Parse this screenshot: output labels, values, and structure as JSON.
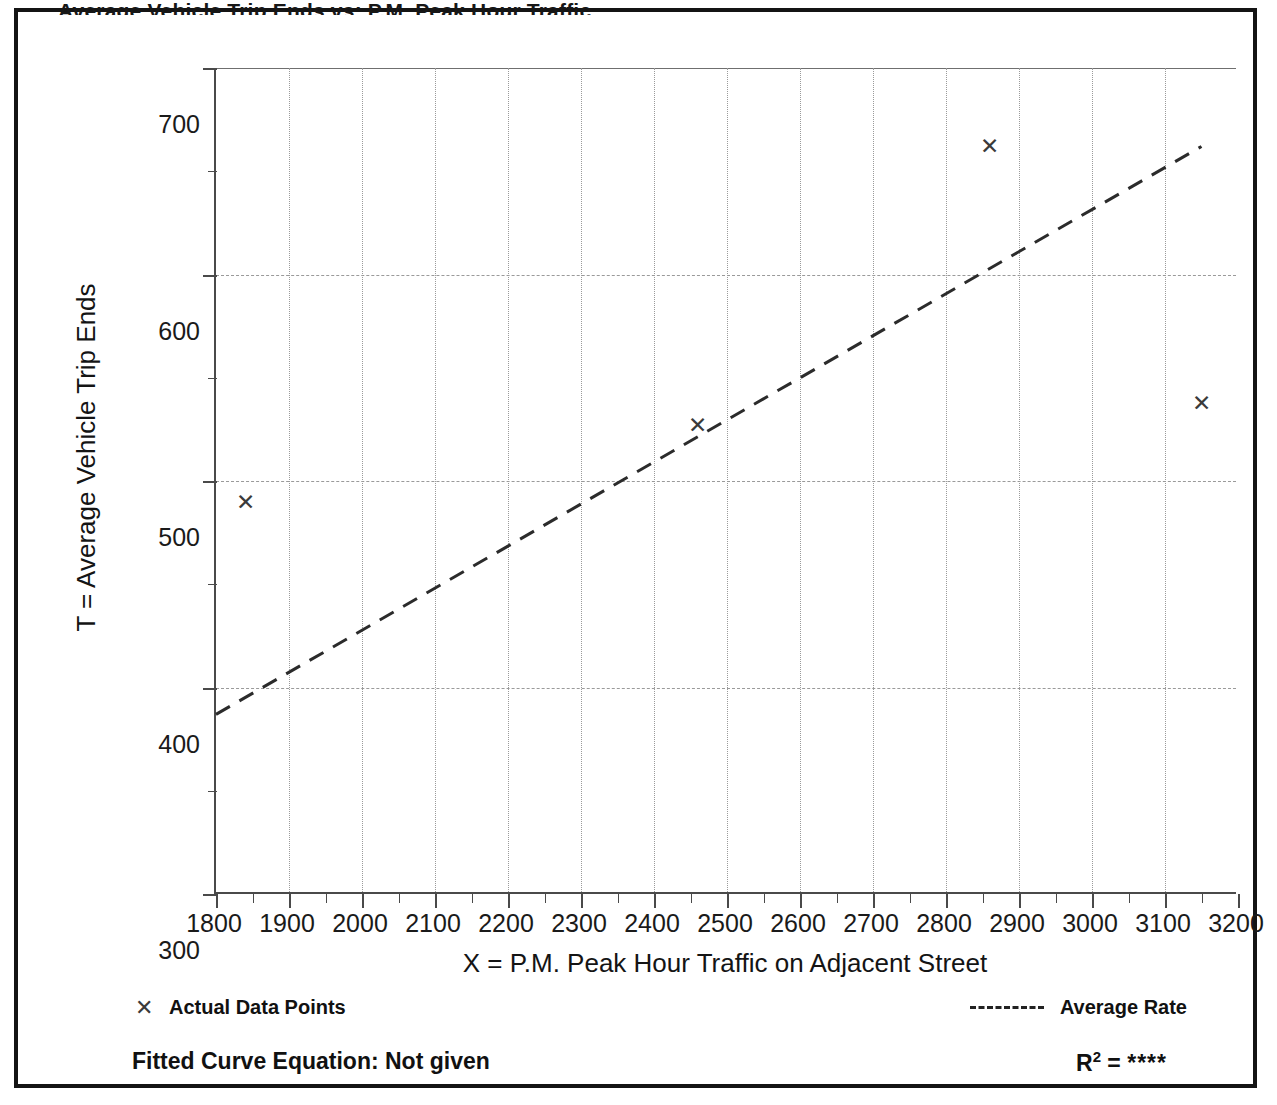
{
  "page": {
    "clipped_title": "Average Vehicle Trip Ends vs: P.M. Peak Hour Traffic"
  },
  "chart_data": {
    "type": "scatter",
    "title": "",
    "xlabel": "X = P.M. Peak Hour Traffic on Adjacent Street",
    "ylabel": "T = Average Vehicle Trip Ends",
    "xlim": [
      1800,
      3200
    ],
    "ylim": [
      300,
      700
    ],
    "x_major_step": 100,
    "x_minor_step": 50,
    "y_major_step": 100,
    "y_minor_step": 50,
    "grid": true,
    "legend_position": "below-axis",
    "x_ticks": [
      1800,
      1900,
      2000,
      2100,
      2200,
      2300,
      2400,
      2500,
      2600,
      2700,
      2800,
      2900,
      3000,
      3100,
      3200
    ],
    "y_ticks": [
      300,
      400,
      500,
      600,
      700
    ],
    "series": [
      {
        "name": "Actual Data Points",
        "marker": "x",
        "points": [
          {
            "x": 1840,
            "y": 490
          },
          {
            "x": 2460,
            "y": 527
          },
          {
            "x": 2860,
            "y": 662
          },
          {
            "x": 3150,
            "y": 538
          }
        ]
      },
      {
        "name": "Average Rate",
        "style": "dashed-line",
        "points": [
          {
            "x": 1800,
            "y": 387
          },
          {
            "x": 3150,
            "y": 662
          }
        ]
      }
    ],
    "annotations": {
      "fitted_curve_equation": "Fitted Curve Equation:  Not given",
      "r_squared_label": "R",
      "r_squared_exponent": "2",
      "r_squared_equals": "=",
      "r_squared_value": "****"
    }
  },
  "legend": {
    "items": [
      {
        "marker": "x-marker",
        "label": "Actual Data Points"
      },
      {
        "marker": "dashed-line",
        "label": "Average Rate"
      }
    ]
  }
}
